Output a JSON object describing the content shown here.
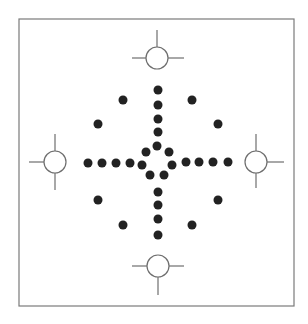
{
  "canvas": {
    "width": 308,
    "height": 324,
    "background": "#ffffff"
  },
  "colors": {
    "frame": "#7a7a7a",
    "line": "#6e6e6e",
    "dot": "#222222",
    "circle_fill": "#ffffff"
  },
  "frame": {
    "x": 19,
    "y": 19,
    "width": 275,
    "height": 287
  },
  "targets": [
    {
      "id": "top",
      "cx": 157,
      "cy": 58,
      "r": 11,
      "lines": [
        {
          "x1": 157,
          "y1": 30,
          "x2": 157,
          "y2": 47
        },
        {
          "x1": 132,
          "y1": 58,
          "x2": 146,
          "y2": 58
        },
        {
          "x1": 168,
          "y1": 58,
          "x2": 184,
          "y2": 58
        }
      ]
    },
    {
      "id": "left",
      "cx": 55,
      "cy": 162,
      "r": 11,
      "lines": [
        {
          "x1": 29,
          "y1": 162,
          "x2": 44,
          "y2": 162
        },
        {
          "x1": 55,
          "y1": 134,
          "x2": 55,
          "y2": 151
        },
        {
          "x1": 55,
          "y1": 173,
          "x2": 55,
          "y2": 190
        }
      ]
    },
    {
      "id": "right",
      "cx": 256,
      "cy": 162,
      "r": 11,
      "lines": [
        {
          "x1": 267,
          "y1": 162,
          "x2": 284,
          "y2": 162
        },
        {
          "x1": 256,
          "y1": 134,
          "x2": 256,
          "y2": 151
        },
        {
          "x1": 256,
          "y1": 173,
          "x2": 256,
          "y2": 188
        }
      ]
    },
    {
      "id": "bottom",
      "cx": 158,
      "cy": 266,
      "r": 11,
      "lines": [
        {
          "x1": 158,
          "y1": 277,
          "x2": 158,
          "y2": 295
        },
        {
          "x1": 132,
          "y1": 266,
          "x2": 147,
          "y2": 266
        },
        {
          "x1": 169,
          "y1": 266,
          "x2": 184,
          "y2": 266
        }
      ]
    }
  ],
  "dot_radius": 4.5,
  "dots": {
    "top_arm": [
      [
        158,
        90
      ],
      [
        158,
        105
      ],
      [
        158,
        119
      ],
      [
        158,
        132
      ]
    ],
    "center_ring": [
      [
        157,
        146
      ],
      [
        146,
        152
      ],
      [
        169,
        152
      ],
      [
        142,
        165
      ],
      [
        172,
        165
      ],
      [
        150,
        175
      ],
      [
        164,
        175
      ]
    ],
    "left_arm": [
      [
        88,
        163
      ],
      [
        102,
        163
      ],
      [
        116,
        163
      ],
      [
        130,
        163
      ]
    ],
    "right_arm": [
      [
        186,
        162
      ],
      [
        199,
        162
      ],
      [
        213,
        162
      ],
      [
        228,
        162
      ]
    ],
    "bottom_arm": [
      [
        158,
        192
      ],
      [
        158,
        205
      ],
      [
        158,
        219
      ],
      [
        158,
        235
      ]
    ],
    "diagonals": [
      [
        123,
        100
      ],
      [
        98,
        124
      ],
      [
        192,
        100
      ],
      [
        218,
        124
      ],
      [
        98,
        200
      ],
      [
        123,
        225
      ],
      [
        218,
        200
      ],
      [
        192,
        225
      ]
    ]
  }
}
